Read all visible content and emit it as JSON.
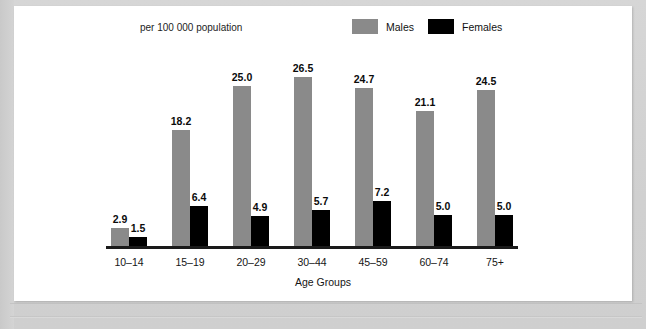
{
  "panel": {
    "subtitle": "per 100 000 population",
    "xaxis_title": "Age Groups"
  },
  "legend": {
    "position": "top-right",
    "items": [
      {
        "label": "Males",
        "color": "#8a8a8a",
        "swatch_name": "legend-swatch-males"
      },
      {
        "label": "Females",
        "color": "#000000",
        "swatch_name": "legend-swatch-females"
      }
    ]
  },
  "colors": {
    "males": "#8a8a8a",
    "females": "#000000",
    "axis": "#1a1a1a",
    "panel_background": "#ffffff",
    "page_background": "#d2d2d2"
  },
  "chart_data": {
    "type": "bar",
    "title": "",
    "subtitle": "per 100 000 population",
    "xlabel": "Age Groups",
    "ylabel": "",
    "ylim": [
      0,
      28
    ],
    "grid": false,
    "legend_position": "top-right",
    "categories": [
      "10–14",
      "15–19",
      "20–29",
      "30–44",
      "45–59",
      "60–74",
      "75+"
    ],
    "series": [
      {
        "name": "Males",
        "color": "#8a8a8a",
        "values": [
          2.9,
          18.2,
          25.0,
          26.5,
          24.7,
          21.1,
          24.5
        ],
        "labels": [
          "2.9",
          "18.2",
          "25.0",
          "26.5",
          "24.7",
          "21.1",
          "24.5"
        ]
      },
      {
        "name": "Females",
        "color": "#000000",
        "values": [
          1.5,
          6.4,
          4.9,
          5.7,
          7.2,
          5.0,
          5.0
        ],
        "labels": [
          "1.5",
          "6.4",
          "4.9",
          "5.7",
          "7.2",
          "5.0",
          "5.0"
        ]
      }
    ]
  }
}
